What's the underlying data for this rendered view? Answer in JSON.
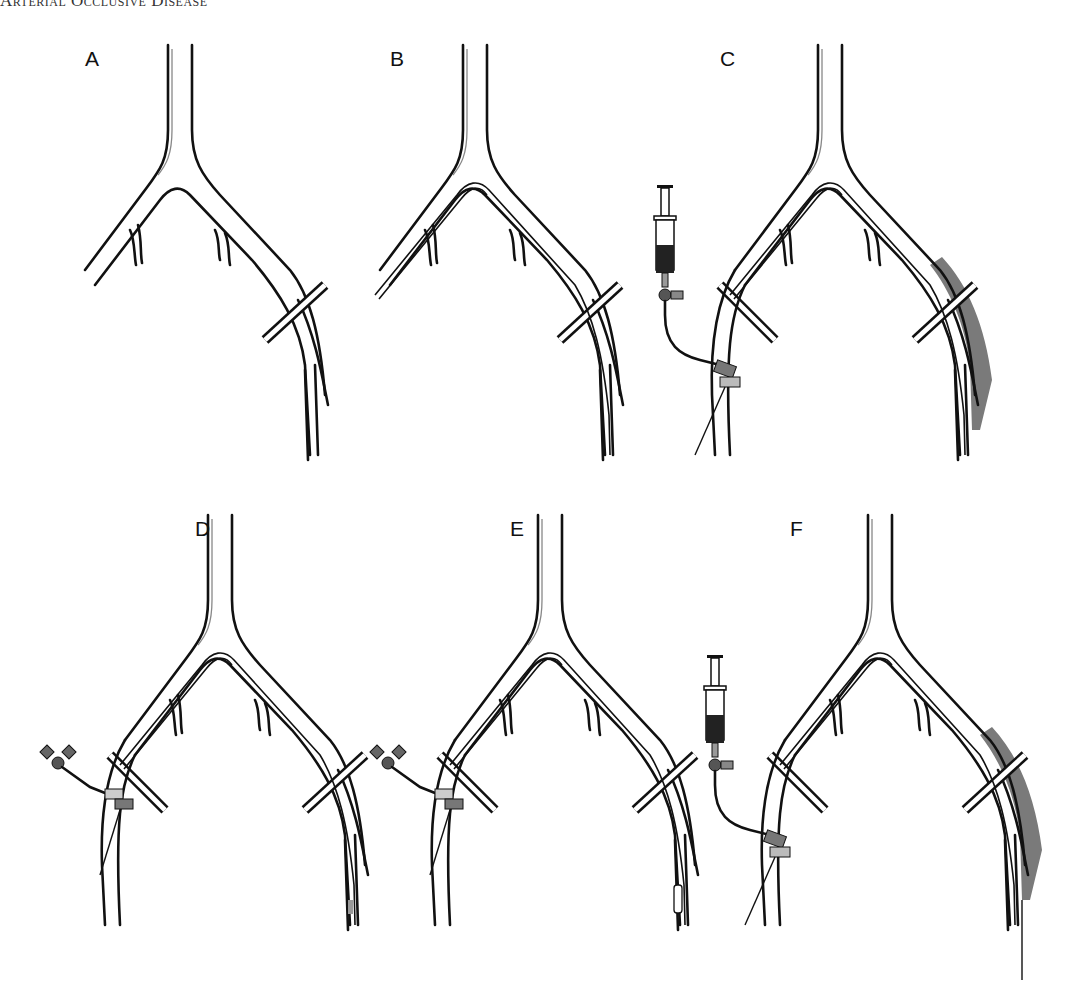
{
  "header": {
    "running_head": "Arterial Occlusive Disease"
  },
  "figure": {
    "panels": [
      {
        "id": "A",
        "label": "A",
        "catheter_in_left": false,
        "catheter_in_right": false,
        "syringe": false,
        "stopcock": false,
        "clot_right": false,
        "catheter_over_bifurcation": false
      },
      {
        "id": "B",
        "label": "B",
        "catheter_in_left": true,
        "catheter_in_right": true,
        "syringe": false,
        "stopcock": false,
        "clot_right": false,
        "catheter_over_bifurcation": true
      },
      {
        "id": "C",
        "label": "C",
        "catheter_in_left": true,
        "catheter_in_right": true,
        "syringe": true,
        "stopcock": false,
        "clot_right": true,
        "catheter_over_bifurcation": true
      },
      {
        "id": "D",
        "label": "D",
        "catheter_in_left": true,
        "catheter_in_right": true,
        "syringe": false,
        "stopcock": true,
        "clot_right": false,
        "catheter_over_bifurcation": true,
        "balloon_tip": "shaded"
      },
      {
        "id": "E",
        "label": "E",
        "catheter_in_left": true,
        "catheter_in_right": true,
        "syringe": false,
        "stopcock": true,
        "clot_right": false,
        "catheter_over_bifurcation": true,
        "balloon_tip": "outlined"
      },
      {
        "id": "F",
        "label": "F",
        "catheter_in_left": true,
        "catheter_in_right": true,
        "syringe": true,
        "stopcock": false,
        "clot_right": true,
        "catheter_over_bifurcation": true,
        "wire_exits_bottom": true
      }
    ]
  },
  "colors": {
    "line": "#111111",
    "clot": "#7a7a7a",
    "syringe_dark": "#222222",
    "background": "#ffffff"
  }
}
